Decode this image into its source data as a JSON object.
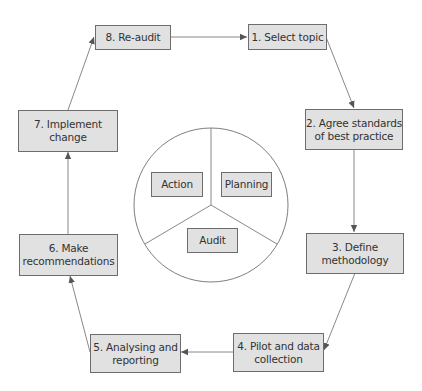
{
  "diagram": {
    "type": "cycle",
    "steps": [
      {
        "id": 1,
        "label": "1. Select topic"
      },
      {
        "id": 2,
        "label": "2. Agree standards\nof best practice"
      },
      {
        "id": 3,
        "label": "3. Define\nmethodology"
      },
      {
        "id": 4,
        "label": "4. Pilot and data\ncollection"
      },
      {
        "id": 5,
        "label": "5. Analysing and\nreporting"
      },
      {
        "id": 6,
        "label": "6. Make\nrecommendations"
      },
      {
        "id": 7,
        "label": "7. Implement\nchange"
      },
      {
        "id": 8,
        "label": "8. Re-audit"
      }
    ],
    "flow": [
      "1→2",
      "2→3",
      "3→4",
      "4→5",
      "5→6",
      "6→7",
      "7→8",
      "8→1"
    ],
    "center_circle": {
      "segments": [
        {
          "label": "Action"
        },
        {
          "label": "Planning"
        },
        {
          "label": "Audit"
        }
      ]
    },
    "colors": {
      "box_fill": "#e1e1e1",
      "box_border": "#6d6d6d",
      "line": "#777777",
      "text": "#333333"
    }
  }
}
